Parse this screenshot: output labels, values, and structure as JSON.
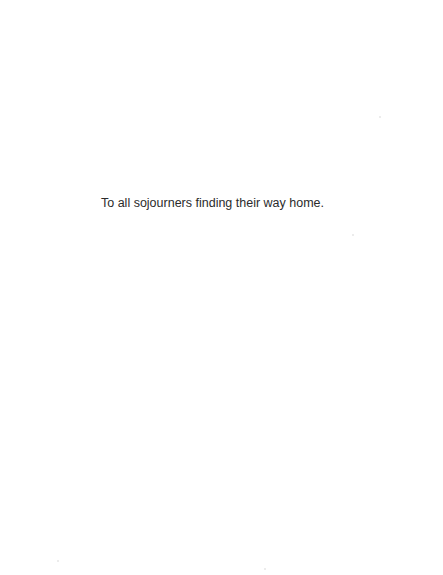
{
  "page": {
    "type": "dedication",
    "background_color": "#ffffff",
    "text_color": "#2b2b2b"
  },
  "dedication": {
    "text": "To all sojourners finding their way home."
  }
}
